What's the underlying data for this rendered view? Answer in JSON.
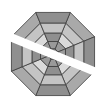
{
  "icon": {
    "semantic": "spiderweb-octagon-slashed-icon",
    "shape": "octagon",
    "rings": 4,
    "sectors": 8,
    "colors": {
      "outline": "#3a3a3a",
      "ring_outer": "#a9a9a9",
      "ring_2": "#c4c4c4",
      "ring_3": "#dadada",
      "ring_inner": "#9a9a9a",
      "sector_alt": "#8f8f8f",
      "slash": "#ffffff",
      "background": "#ffffff"
    }
  }
}
